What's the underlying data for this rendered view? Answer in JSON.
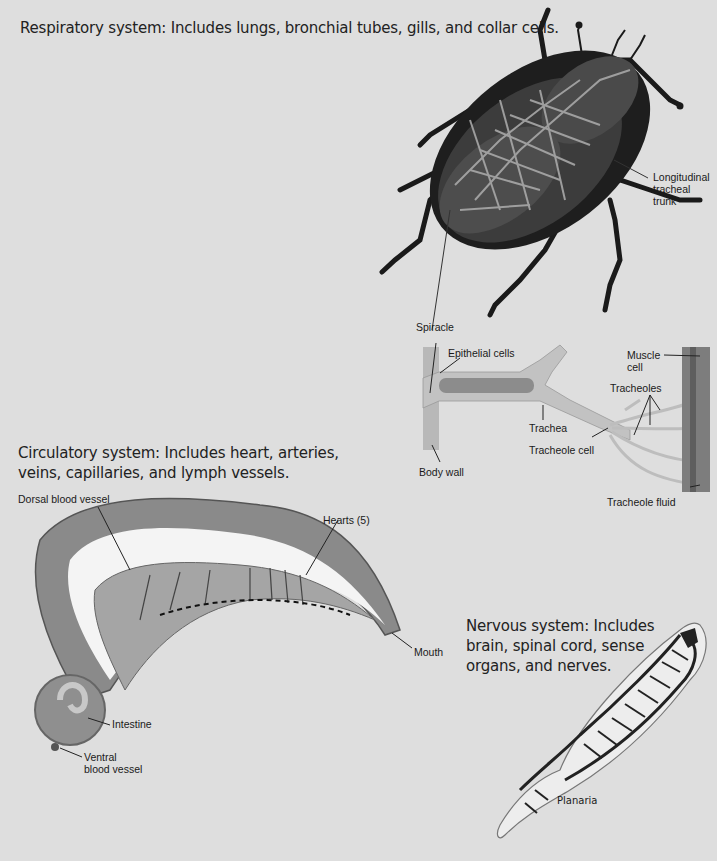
{
  "sections": {
    "respiratory": {
      "heading": "Respiratory system: Includes lungs, bronchial tubes, gills, and collar cells.",
      "labels": {
        "longitudinal_1": "Longitudinal",
        "longitudinal_2": "tracheal",
        "longitudinal_3": "trunk",
        "spiracle": "Spiracle",
        "epithelial": "Epithelial cells",
        "muscle_1": "Muscle",
        "muscle_2": "cell",
        "tracheoles": "Tracheoles",
        "trachea": "Trachea",
        "tracheole_cell": "Tracheole cell",
        "body_wall": "Body wall",
        "tracheole_fluid": "Tracheole fluid"
      }
    },
    "circulatory": {
      "heading_line1": "Circulatory system: Includes heart, arteries,",
      "heading_line2": "veins, capillaries, and lymph vessels.",
      "labels": {
        "dorsal": "Dorsal blood vessel",
        "hearts": "Hearts (5)",
        "mouth": "Mouth",
        "intestine": "Intestine",
        "ventral_1": "Ventral",
        "ventral_2": "blood vessel"
      }
    },
    "nervous": {
      "heading_line1": "Nervous system: Includes",
      "heading_line2": "brain, spinal cord, sense",
      "heading_line3": "organs, and nerves.",
      "labels": {
        "planaria": "Planaria"
      }
    }
  },
  "colors": {
    "background": "#dedede",
    "beetle_dark": "#1e1e1e",
    "beetle_mid": "#4a4a4a",
    "trachea_light": "#b5b5b5",
    "worm_body": "#8a8a8a",
    "worm_inner": "#f4f4f4"
  }
}
